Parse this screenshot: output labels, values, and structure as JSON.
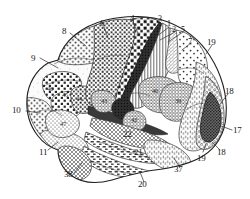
{
  "figure": {
    "kind": "brodmann-cytoarchitectonic-map",
    "view": "lateral",
    "ink_color": "#2a2a2a",
    "paper_color": "#ffffff",
    "leader_line_color": "#3a3a3a"
  },
  "labels": [
    {
      "id": "a8",
      "text": "8",
      "x": 62,
      "y": 27,
      "leader": true
    },
    {
      "id": "a9",
      "text": "9",
      "x": 31,
      "y": 54,
      "leader": true
    },
    {
      "id": "a6",
      "text": "6",
      "x": 100,
      "y": 19,
      "leader": true
    },
    {
      "id": "a4",
      "text": "4",
      "x": 130,
      "y": 14,
      "leader": true
    },
    {
      "id": "a3",
      "text": "3",
      "x": 158,
      "y": 15,
      "leader": true
    },
    {
      "id": "a1",
      "text": "1",
      "x": 167,
      "y": 20,
      "leader": true
    },
    {
      "id": "a2",
      "text": "2",
      "x": 172,
      "y": 26,
      "leader": true
    },
    {
      "id": "a5",
      "text": "5",
      "x": 180,
      "y": 26,
      "leader": true
    },
    {
      "id": "a7",
      "text": "7",
      "x": 188,
      "y": 37,
      "leader": true
    },
    {
      "id": "a19t",
      "text": "19",
      "x": 209,
      "y": 38,
      "leader": false
    },
    {
      "id": "a18t",
      "text": "18",
      "x": 226,
      "y": 87,
      "leader": true
    },
    {
      "id": "a17",
      "text": "17",
      "x": 234,
      "y": 128,
      "leader": true
    },
    {
      "id": "a18b",
      "text": "18",
      "x": 219,
      "y": 152,
      "leader": true
    },
    {
      "id": "a19b",
      "text": "19",
      "x": 199,
      "y": 155,
      "leader": true
    },
    {
      "id": "a10",
      "text": "10",
      "x": 14,
      "y": 109,
      "leader": true
    },
    {
      "id": "a11",
      "text": "11",
      "x": 41,
      "y": 152,
      "leader": true
    },
    {
      "id": "a38",
      "text": "38",
      "x": 66,
      "y": 175,
      "leader": true
    },
    {
      "id": "a20",
      "text": "20",
      "x": 140,
      "y": 184,
      "leader": true
    },
    {
      "id": "a37",
      "text": "37",
      "x": 176,
      "y": 170,
      "leader": true
    },
    {
      "id": "a21",
      "text": "21",
      "x": 136,
      "y": 152,
      "leader": false
    },
    {
      "id": "a22",
      "text": "22",
      "x": 125,
      "y": 133,
      "leader": false
    }
  ],
  "interior_labels": [
    {
      "id": "i46",
      "text": "46",
      "x": 47,
      "y": 86
    },
    {
      "id": "i45",
      "text": "45",
      "x": 62,
      "y": 92
    },
    {
      "id": "i44",
      "text": "44",
      "x": 76,
      "y": 96
    },
    {
      "id": "i47",
      "text": "47",
      "x": 60,
      "y": 121
    },
    {
      "id": "i43",
      "text": "43",
      "x": 101,
      "y": 98
    },
    {
      "id": "i41",
      "text": "41",
      "x": 123,
      "y": 108
    },
    {
      "id": "i42",
      "text": "42",
      "x": 132,
      "y": 117
    },
    {
      "id": "i40",
      "text": "40",
      "x": 152,
      "y": 88
    },
    {
      "id": "i39",
      "text": "39",
      "x": 175,
      "y": 98
    }
  ]
}
